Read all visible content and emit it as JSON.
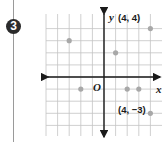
{
  "problem": {
    "number": "3"
  },
  "chart_data": {
    "type": "scatter",
    "title": "",
    "xlabel": "x",
    "ylabel": "y",
    "origin_label": "O",
    "xlim": [
      -5,
      4
    ],
    "ylim": [
      -4,
      4
    ],
    "grid": true,
    "points": [
      {
        "x": 4,
        "y": 4,
        "label": "(4, 4)"
      },
      {
        "x": -3,
        "y": 3,
        "label": ""
      },
      {
        "x": 1,
        "y": 2,
        "label": ""
      },
      {
        "x": -2,
        "y": -1,
        "label": ""
      },
      {
        "x": 2,
        "y": -1,
        "label": ""
      },
      {
        "x": 3,
        "y": -1,
        "label": ""
      },
      {
        "x": 4,
        "y": -3,
        "label": "(4, −3)"
      }
    ],
    "point_color": "#a8a8a8"
  },
  "labels": {
    "x_axis": "x",
    "y_axis": "y",
    "origin": "O",
    "point_4_4": "(4, 4)",
    "point_4_neg3": "(4, −3)"
  }
}
